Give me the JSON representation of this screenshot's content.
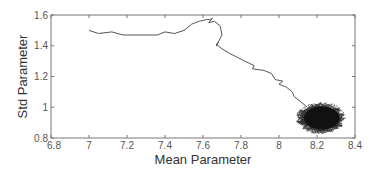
{
  "chart_data": {
    "type": "line",
    "title": "",
    "xlabel": "Mean Parameter",
    "ylabel": "Std Parameter",
    "xlim": [
      6.8,
      8.4
    ],
    "ylim": [
      0.8,
      1.6
    ],
    "xticks": [
      6.8,
      7,
      7.2,
      7.4,
      7.6,
      7.8,
      8,
      8.2,
      8.4
    ],
    "xtick_labels": [
      "6.8",
      "7",
      "7.2",
      "7.4",
      "7.6",
      "7.8",
      "8",
      "8.2",
      "8.4"
    ],
    "yticks": [
      0.8,
      1,
      1.2,
      1.4,
      1.6
    ],
    "ytick_labels": [
      "0.8",
      "1",
      "1.2",
      "1.4",
      "1.6"
    ],
    "grid": false,
    "legend": null,
    "series": [
      {
        "name": "trajectory",
        "color": "#555555",
        "x": [
          7.0,
          7.05,
          7.12,
          7.18,
          7.22,
          7.28,
          7.36,
          7.4,
          7.45,
          7.5,
          7.54,
          7.58,
          7.62,
          7.64,
          7.65,
          7.63,
          7.66,
          7.69,
          7.7,
          7.67,
          7.68,
          7.67,
          7.7,
          7.74,
          7.82,
          7.87,
          7.86,
          7.92,
          7.96,
          7.98,
          8.02,
          8.0,
          8.04,
          8.07,
          8.08,
          8.1,
          8.15,
          8.2,
          8.22
        ],
        "y": [
          1.5,
          1.48,
          1.49,
          1.47,
          1.47,
          1.47,
          1.47,
          1.49,
          1.48,
          1.5,
          1.54,
          1.56,
          1.57,
          1.57,
          1.58,
          1.55,
          1.56,
          1.53,
          1.47,
          1.4,
          1.42,
          1.41,
          1.38,
          1.35,
          1.3,
          1.27,
          1.25,
          1.24,
          1.22,
          1.18,
          1.17,
          1.15,
          1.13,
          1.1,
          1.07,
          1.05,
          1.0,
          0.97,
          0.93
        ]
      }
    ],
    "annotations": [
      {
        "type": "dense-cluster",
        "center": [
          8.22,
          0.93
        ],
        "x_range": [
          8.1,
          8.34
        ],
        "y_range": [
          0.83,
          1.02
        ],
        "color": "#111111"
      }
    ]
  }
}
